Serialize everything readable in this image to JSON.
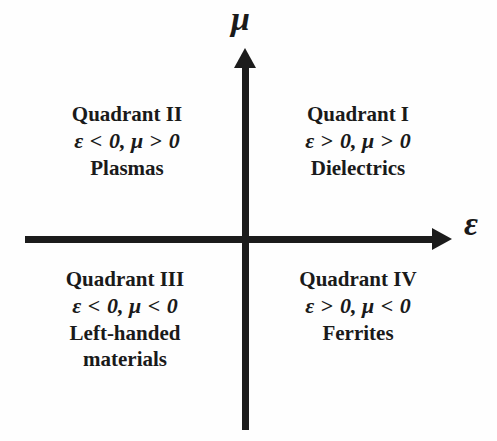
{
  "figure": {
    "background_color": "#fefefe",
    "line_color": "#1c1c1c"
  },
  "axes": {
    "vertical": {
      "label": "μ",
      "name": "permeability",
      "direction": "up"
    },
    "horizontal": {
      "label": "ε",
      "name": "permittivity",
      "direction": "right"
    }
  },
  "quadrants": [
    {
      "id": "quadrant-1",
      "title": "Quadrant I",
      "condition": {
        "eps_symbol": "ε",
        "eps_op": ">",
        "eps_value": "0,",
        "mu_symbol": "μ",
        "mu_op": ">",
        "mu_value": "0"
      },
      "material_lines": [
        "Dielectrics"
      ]
    },
    {
      "id": "quadrant-2",
      "title": "Quadrant II",
      "condition": {
        "eps_symbol": "ε",
        "eps_op": "<",
        "eps_value": "0,",
        "mu_symbol": "μ",
        "mu_op": ">",
        "mu_value": "0"
      },
      "material_lines": [
        "Plasmas"
      ]
    },
    {
      "id": "quadrant-3",
      "title": "Quadrant III",
      "condition": {
        "eps_symbol": "ε",
        "eps_op": "<",
        "eps_value": "0,",
        "mu_symbol": "μ",
        "mu_op": "<",
        "mu_value": "0"
      },
      "material_lines": [
        "Left-handed",
        "materials"
      ]
    },
    {
      "id": "quadrant-4",
      "title": "Quadrant IV",
      "condition": {
        "eps_symbol": "ε",
        "eps_op": ">",
        "eps_value": "0,",
        "mu_symbol": "μ",
        "mu_op": "<",
        "mu_value": "0"
      },
      "material_lines": [
        "Ferrites"
      ]
    }
  ]
}
